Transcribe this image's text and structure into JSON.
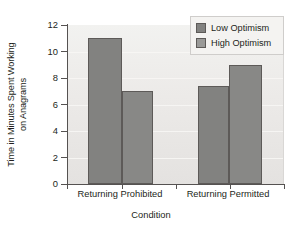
{
  "chart_data": {
    "type": "bar",
    "title": "",
    "xlabel": "Condition",
    "ylabel_line1": "Time in Minutes Spent Working",
    "ylabel_line2": "on Anagrams",
    "ylabel": "Time in Minutes Spent Working on Anagrams",
    "categories": [
      "Returning Prohibited",
      "Returning Permitted"
    ],
    "series": [
      {
        "name": "Low Optimism",
        "values": [
          11.0,
          7.4
        ],
        "color": "#828280"
      },
      {
        "name": "High Optimism",
        "values": [
          7.0,
          9.0
        ],
        "color": "#9a9a98"
      }
    ],
    "ylim": [
      0,
      12
    ],
    "ytick_labels": [
      "12",
      "10",
      "8",
      "6",
      "4",
      "2",
      "0"
    ],
    "ytick_values": [
      12,
      10,
      8,
      6,
      4,
      2,
      0
    ],
    "grid": true,
    "legend_position": "upper right",
    "bar_edge_color": "#5d5a58",
    "plot_background": "#eceae8"
  },
  "legend": {
    "items": [
      {
        "label": "Low Optimism"
      },
      {
        "label": "High Optimism"
      }
    ]
  }
}
